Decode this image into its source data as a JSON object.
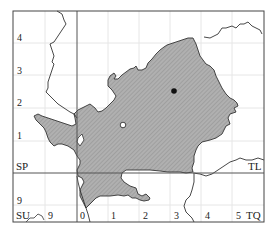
{
  "map": {
    "grid_squares": {
      "top_left": "SP",
      "top_right": "TL",
      "bottom_left": "SU",
      "bottom_right": "TQ"
    },
    "left_axis_labels": [
      "4",
      "3",
      "2",
      "1",
      "9"
    ],
    "bottom_axis_labels": [
      "9",
      "0",
      "1",
      "2",
      "3",
      "4",
      "5"
    ],
    "colors": {
      "region_fill": "#a9a9a9",
      "region_stroke": "#333333",
      "frame": "#444444",
      "grid": "#e4e4e4",
      "boundary": "#333333"
    },
    "markers": [
      {
        "type": "filled-dot",
        "x": 174,
        "y": 91
      },
      {
        "type": "open-circle",
        "x": 123,
        "y": 125
      }
    ]
  }
}
